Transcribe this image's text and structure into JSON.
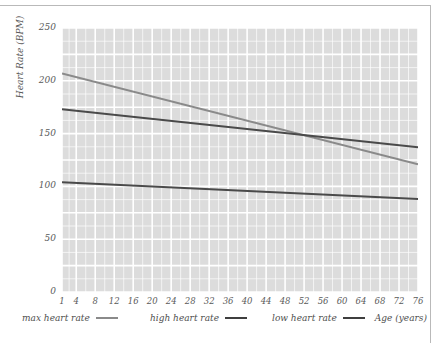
{
  "chart_data": {
    "type": "line",
    "title": "",
    "xlabel": "Age (years)",
    "ylabel": "Heart Rate (BPM)",
    "xlim": [
      1,
      76
    ],
    "ylim": [
      0,
      250
    ],
    "grid": true,
    "legend_position": "bottom-left",
    "x_ticks": [
      1,
      4,
      8,
      12,
      16,
      20,
      24,
      28,
      32,
      36,
      40,
      44,
      48,
      52,
      56,
      60,
      64,
      68,
      72,
      76
    ],
    "y_ticks": [
      0,
      50,
      100,
      150,
      200,
      250
    ],
    "x": [
      1,
      76
    ],
    "series": [
      {
        "name": "max heart rate",
        "color": "#8a8a8a",
        "values": [
          207,
          121
        ]
      },
      {
        "name": "high heart rate",
        "color": "#4a4a4a",
        "values": [
          173,
          137
        ]
      },
      {
        "name": "low heart rate",
        "color": "#4a4a4a",
        "values": [
          104,
          88
        ]
      }
    ]
  },
  "legend": {
    "items": [
      {
        "label": "max heart rate",
        "color": "#8a8a8a"
      },
      {
        "label": "high heart rate",
        "color": "#3f3f3f"
      },
      {
        "label": "low heart rate",
        "color": "#3f3f3f"
      }
    ]
  },
  "axes": {
    "y_title": "Heart Rate (BPM)",
    "x_title": "Age (years)",
    "y_tick_labels": [
      "250",
      "200",
      "150",
      "100",
      "50",
      "0"
    ],
    "x_tick_labels": [
      "1",
      "4",
      "8",
      "12",
      "16",
      "20",
      "24",
      "28",
      "32",
      "36",
      "40",
      "44",
      "48",
      "52",
      "56",
      "60",
      "64",
      "68",
      "72",
      "76"
    ]
  },
  "colors": {
    "plot_background": "#dcdcdc",
    "gridline": "#ffffff",
    "frame_rule": "#b9b9b9",
    "tick_text": "#5a5a5a"
  }
}
